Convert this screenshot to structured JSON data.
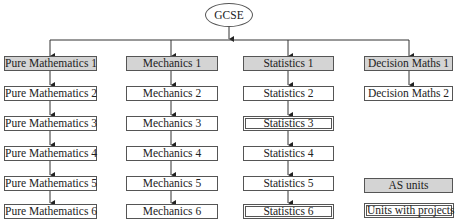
{
  "root": {
    "label": "GCSE"
  },
  "columns": [
    {
      "name": "pure",
      "units": [
        {
          "label": "Pure Mathematics 1",
          "type": "as"
        },
        {
          "label": "Pure Mathematics 2",
          "type": "normal"
        },
        {
          "label": "Pure Mathematics 3",
          "type": "normal"
        },
        {
          "label": "Pure Mathematics 4",
          "type": "normal"
        },
        {
          "label": "Pure Mathematics 5",
          "type": "normal"
        },
        {
          "label": "Pure Mathematics 6",
          "type": "normal"
        }
      ]
    },
    {
      "name": "mechanics",
      "units": [
        {
          "label": "Mechanics 1",
          "type": "as"
        },
        {
          "label": "Mechanics 2",
          "type": "normal"
        },
        {
          "label": "Mechanics 3",
          "type": "normal"
        },
        {
          "label": "Mechanics 4",
          "type": "normal"
        },
        {
          "label": "Mechanics 5",
          "type": "normal"
        },
        {
          "label": "Mechanics 6",
          "type": "normal"
        }
      ]
    },
    {
      "name": "statistics",
      "units": [
        {
          "label": "Statistics 1",
          "type": "as"
        },
        {
          "label": "Statistics 2",
          "type": "normal"
        },
        {
          "label": "Statistics 3",
          "type": "project"
        },
        {
          "label": "Statistics 4",
          "type": "normal"
        },
        {
          "label": "Statistics 5",
          "type": "normal"
        },
        {
          "label": "Statistics 6",
          "type": "project"
        }
      ]
    },
    {
      "name": "decision",
      "units": [
        {
          "label": "Decision Maths 1",
          "type": "as"
        },
        {
          "label": "Decision Maths 2",
          "type": "normal"
        }
      ]
    }
  ],
  "legend": {
    "as_units": "AS units",
    "project_units": "Units with projects"
  },
  "colors": {
    "as_fill": "#d4d4d4",
    "border": "#555555"
  }
}
